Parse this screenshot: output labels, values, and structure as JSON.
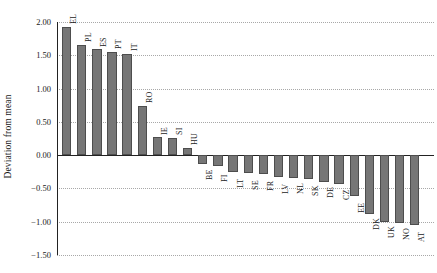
{
  "chart_data": {
    "type": "bar",
    "title": "",
    "subtitle": "",
    "xlabel": "",
    "ylabel": "Deviation from mean",
    "ylim": [
      -1.5,
      2.0
    ],
    "yticks": [
      "2.00",
      "1.50",
      "1.00",
      "0.50",
      "0.00",
      "-0.50",
      "-1.00",
      "-1.50"
    ],
    "ytick_values": [
      2.0,
      1.5,
      1.0,
      0.5,
      0.0,
      -0.5,
      -1.0,
      -1.5
    ],
    "grid": "horizontal-dotted",
    "legend": "none",
    "bar_color": "#767676",
    "bar_edge_color": "#4d4d4d",
    "categories": [
      "EL",
      "PL",
      "ES",
      "PT",
      "IT",
      "RO",
      "IE",
      "SI",
      "HU",
      "BE",
      "FI",
      "LT",
      "SE",
      "FR",
      "LV",
      "NL",
      "SK",
      "DE",
      "CZ",
      "EE",
      "DK",
      "UK",
      "NO",
      "AT"
    ],
    "values": [
      1.93,
      1.66,
      1.59,
      1.55,
      1.52,
      0.74,
      0.27,
      0.26,
      0.11,
      -0.13,
      -0.16,
      -0.25,
      -0.27,
      -0.29,
      -0.33,
      -0.34,
      -0.36,
      -0.4,
      -0.43,
      -0.62,
      -0.88,
      -1.0,
      -1.02,
      -1.05
    ]
  }
}
